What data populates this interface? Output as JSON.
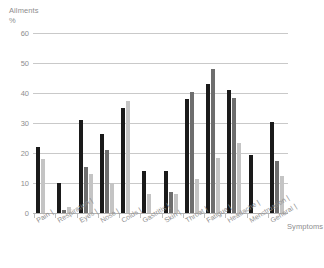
{
  "chart_data": {
    "type": "bar",
    "title": "",
    "ylabel": "Ailments\n%",
    "xlabel": "Symptoms",
    "ylim": [
      0,
      60
    ],
    "yticks": [
      0,
      10,
      20,
      30,
      40,
      50,
      60
    ],
    "grid": true,
    "legend": "none",
    "categories": [
      "Pain",
      "Respiration",
      "Eyes",
      "Nose",
      "Colds",
      "Gastritis",
      "Skin",
      "Throat",
      "Fatigue",
      "Headache",
      "Menstruation",
      "General"
    ],
    "series": [
      {
        "name": "series-1",
        "color": "#1a1a1a",
        "values": [
          22,
          10,
          31,
          26.5,
          35,
          14,
          14,
          38,
          43,
          41,
          19.5,
          30.5
        ]
      },
      {
        "name": "series-2",
        "color": "#6e6e6e",
        "values": [
          0,
          1,
          15.5,
          21,
          0,
          0,
          7,
          40.5,
          48,
          38.5,
          0,
          17.5
        ]
      },
      {
        "name": "series-3",
        "color": "#c4c4c4",
        "values": [
          18,
          2,
          13,
          10,
          37.5,
          6.5,
          6.5,
          11.5,
          18.5,
          23.5,
          0,
          12.5
        ]
      }
    ]
  },
  "axis": {
    "y_title_line1": "Ailments",
    "y_title_line2": "%",
    "x_title": "Symptoms"
  },
  "ytick_labels": [
    "0",
    "10",
    "20",
    "30",
    "40",
    "50",
    "60"
  ]
}
